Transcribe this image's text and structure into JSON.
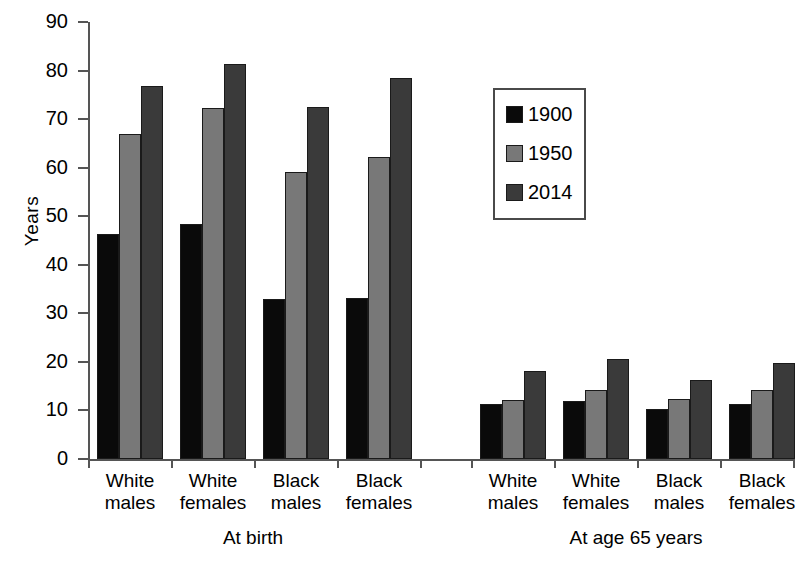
{
  "chart_data": {
    "type": "bar",
    "title": "",
    "subtitle": "",
    "xlabel": "",
    "ylabel": "Years",
    "ylim": [
      0,
      90
    ],
    "ytick_step": 10,
    "ytick_labels": [
      "90",
      "80",
      "70",
      "60",
      "50",
      "40",
      "30",
      "20",
      "10",
      "0"
    ],
    "ytick_values": [
      90,
      80,
      70,
      60,
      50,
      40,
      30,
      20,
      10,
      0
    ],
    "grid": false,
    "legend_position": "upper-center-right",
    "categories": [
      "White males",
      "White females",
      "Black males",
      "Black females"
    ],
    "panels": [
      {
        "name": "At birth",
        "label": "At birth",
        "categories": [
          "White males",
          "White females",
          "Black males",
          "Black females"
        ],
        "series": [
          {
            "name": "1900",
            "values": [
              46.3,
              48.3,
              33.0,
              33.2
            ]
          },
          {
            "name": "1950",
            "values": [
              67.0,
              72.2,
              59.1,
              62.1
            ]
          },
          {
            "name": "2014",
            "values": [
              76.9,
              81.4,
              72.5,
              78.4
            ]
          }
        ]
      },
      {
        "name": "At age 65 years",
        "label": "At age 65 years",
        "categories": [
          "White males",
          "White females",
          "Black males",
          "Black females"
        ],
        "series": [
          {
            "name": "1900",
            "values": [
              11.3,
              12.0,
              10.4,
              11.4
            ]
          },
          {
            "name": "1950",
            "values": [
              12.2,
              14.2,
              12.3,
              14.3
            ]
          },
          {
            "name": "2014",
            "values": [
              18.2,
              20.6,
              16.2,
              19.7
            ]
          }
        ]
      }
    ],
    "series_colors": [
      {
        "name": "1900",
        "color": "#0a0a0a"
      },
      {
        "name": "1950",
        "color": "#787878"
      },
      {
        "name": "2014",
        "color": "#3a3a3a"
      }
    ],
    "legend": {
      "entries": [
        {
          "label": "1900",
          "color": "#0a0a0a"
        },
        {
          "label": "1950",
          "color": "#787878"
        },
        {
          "label": "2014",
          "color": "#3a3a3a"
        }
      ]
    },
    "axis_color": "#555555",
    "bar_border_color": "#1a1a1a",
    "background": "#ffffff"
  }
}
